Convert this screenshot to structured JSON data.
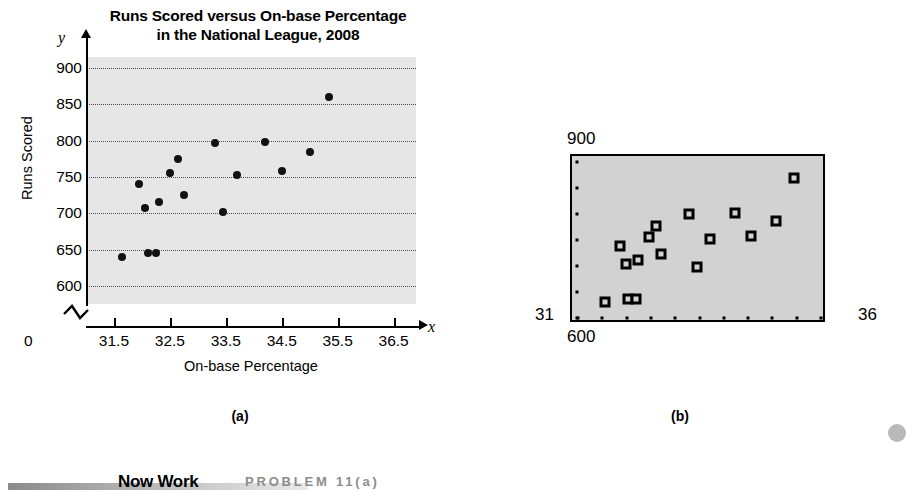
{
  "figure": {
    "caption_a": "(a)",
    "caption_b": "(b)"
  },
  "footer": {
    "now_work_label": "Now Work",
    "problem_ref": "PROBLEM 11(a)"
  },
  "chart_data": [
    {
      "id": "panel-a",
      "type": "scatter",
      "title": "Runs Scored versus On-base Percentage in the National League, 2008",
      "title_line1": "Runs Scored versus On-base Percentage",
      "title_line2": "in the National League, 2008",
      "xlabel": "On-base Percentage",
      "ylabel": "Runs Scored",
      "x_axis_symbol": "x",
      "y_axis_symbol": "y",
      "origin_label": "0",
      "xlim": [
        31.0,
        36.9
      ],
      "ylim": [
        575,
        915
      ],
      "xticks": [
        31.5,
        32.5,
        33.5,
        34.5,
        35.5,
        36.5
      ],
      "xtick_labels": [
        "31.5",
        "32.5",
        "33.5",
        "34.5",
        "35.5",
        "36.5"
      ],
      "yticks": [
        600,
        650,
        700,
        750,
        800,
        850,
        900
      ],
      "ytick_labels": [
        "600",
        "650",
        "700",
        "750",
        "800",
        "850",
        "900"
      ],
      "grid": "horizontal-dotted",
      "axis_break": true,
      "legend": "none",
      "points": [
        {
          "x": 31.65,
          "y": 640
        },
        {
          "x": 31.95,
          "y": 740
        },
        {
          "x": 32.05,
          "y": 707
        },
        {
          "x": 32.1,
          "y": 645
        },
        {
          "x": 32.25,
          "y": 645
        },
        {
          "x": 32.3,
          "y": 715
        },
        {
          "x": 32.5,
          "y": 755
        },
        {
          "x": 32.65,
          "y": 775
        },
        {
          "x": 32.75,
          "y": 725
        },
        {
          "x": 33.3,
          "y": 797
        },
        {
          "x": 33.45,
          "y": 702
        },
        {
          "x": 33.7,
          "y": 752
        },
        {
          "x": 34.2,
          "y": 798
        },
        {
          "x": 34.5,
          "y": 758
        },
        {
          "x": 35.0,
          "y": 784
        },
        {
          "x": 35.35,
          "y": 860
        }
      ]
    },
    {
      "id": "panel-b",
      "type": "scatter",
      "title": "",
      "description": "Graphing calculator scatter diagram of the same data",
      "xlabel": "",
      "ylabel": "",
      "xlim": [
        31,
        36
      ],
      "ylim": [
        600,
        900
      ],
      "corner_labels": {
        "top_left_y_max": "900",
        "bottom_left_y_min": "600",
        "bottom_left_x_min": "31",
        "bottom_right_x_max": "36"
      },
      "x_axis_tick_count": 11,
      "y_axis_tick_count": 7,
      "points": [
        {
          "x": 31.65,
          "y": 640
        },
        {
          "x": 31.95,
          "y": 740
        },
        {
          "x": 32.05,
          "y": 707
        },
        {
          "x": 32.1,
          "y": 645
        },
        {
          "x": 32.25,
          "y": 645
        },
        {
          "x": 32.3,
          "y": 715
        },
        {
          "x": 32.5,
          "y": 755
        },
        {
          "x": 32.65,
          "y": 775
        },
        {
          "x": 32.75,
          "y": 725
        },
        {
          "x": 33.3,
          "y": 797
        },
        {
          "x": 33.45,
          "y": 702
        },
        {
          "x": 33.7,
          "y": 752
        },
        {
          "x": 34.2,
          "y": 798
        },
        {
          "x": 34.5,
          "y": 758
        },
        {
          "x": 35.0,
          "y": 784
        },
        {
          "x": 35.35,
          "y": 860
        }
      ]
    }
  ]
}
